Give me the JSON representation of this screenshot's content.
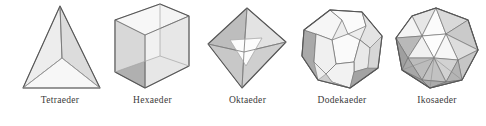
{
  "figure": {
    "background_color": "#ffffff",
    "edge_color": "#555555",
    "label_color": "#3a3a3a",
    "width": 486,
    "height": 126
  },
  "palette": {
    "face_light": "#f2f2f2",
    "face_mid": "#e0e0e0",
    "face_dark": "#b4b4b4",
    "face_darker": "#9a9a9a",
    "face_white": "#fbfbfb",
    "edge": "#555555",
    "edge_soft": "#8c8c8c"
  },
  "solids": [
    {
      "id": "tetraeder",
      "label": "Tetraeder",
      "faces": 4,
      "vertices": 4,
      "edges": 6,
      "face_shape": "triangle",
      "x": 10,
      "width": 100,
      "label_x": 60
    },
    {
      "id": "hexaeder",
      "label": "Hexaeder",
      "faces": 6,
      "vertices": 8,
      "edges": 12,
      "face_shape": "square",
      "x": 105,
      "width": 95,
      "label_x": 145
    },
    {
      "id": "oktaeder",
      "label": "Oktaeder",
      "faces": 8,
      "vertices": 6,
      "edges": 12,
      "face_shape": "triangle",
      "x": 200,
      "width": 95,
      "label_x": 234
    },
    {
      "id": "dodekaeder",
      "label": "Dodekaeder",
      "faces": 12,
      "vertices": 20,
      "edges": 30,
      "face_shape": "pentagon",
      "x": 292,
      "width": 100,
      "label_x": 328
    },
    {
      "id": "ikosaeder",
      "label": "Ikosaeder",
      "faces": 20,
      "vertices": 12,
      "edges": 30,
      "face_shape": "triangle",
      "x": 388,
      "width": 98,
      "label_x": 430
    }
  ]
}
